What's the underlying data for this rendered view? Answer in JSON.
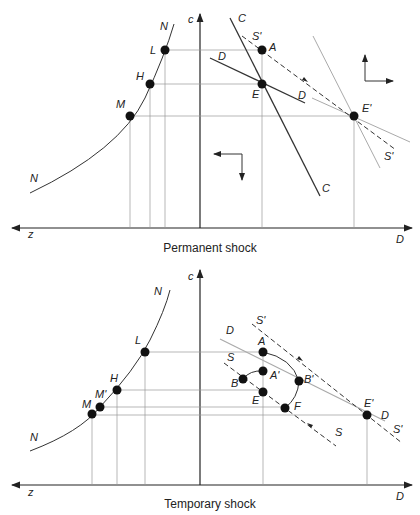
{
  "panels": [
    {
      "caption": "Permanent shock",
      "axes": {
        "vertical": "c",
        "left": "z",
        "right": "D"
      },
      "curve_label": "N",
      "points": {
        "L": "L",
        "H": "H",
        "M": "M",
        "A": "A",
        "E": "E",
        "E_prime": "E'"
      },
      "lines": {
        "C": "C",
        "D": "D",
        "S_prime": "S'"
      }
    },
    {
      "caption": "Temporary shock",
      "axes": {
        "vertical": "c",
        "left": "z",
        "right": "D"
      },
      "curve_label": "N",
      "points": {
        "L": "L",
        "H": "H",
        "M_prime": "M'",
        "M": "M",
        "A": "A",
        "A_prime": "A'",
        "B": "B",
        "B_prime": "B'",
        "E": "E",
        "F": "F",
        "E_prime": "E'"
      },
      "lines": {
        "D": "D",
        "S": "S",
        "S_prime": "S'"
      }
    }
  ]
}
